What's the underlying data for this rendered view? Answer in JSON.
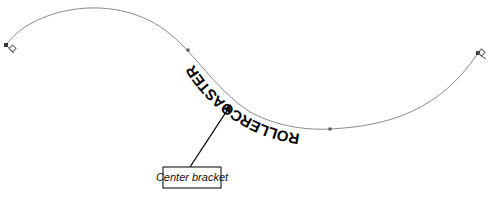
{
  "illustration": {
    "path_text": "ROLLERCOASTER",
    "path_text_orientation": "upside-down, below path",
    "curve_color": "#8a8a8a",
    "text_color": "#000000",
    "anchors": [
      {
        "name": "start",
        "x": 6,
        "y": 45
      },
      {
        "name": "node-1",
        "x": 188,
        "y": 50
      },
      {
        "name": "node-2",
        "x": 330,
        "y": 129
      },
      {
        "name": "end",
        "x": 478,
        "y": 53
      }
    ]
  },
  "callout": {
    "label": "Center bracket",
    "border_color": "#000000"
  }
}
